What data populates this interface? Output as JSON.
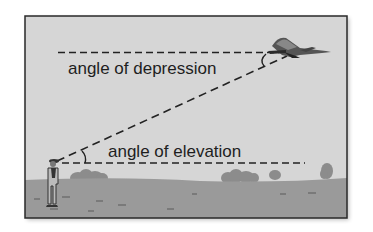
{
  "figure": {
    "labels": {
      "depression": "angle of depression",
      "elevation": "angle of elevation"
    },
    "elements": {
      "observer": "person-standing-on-ground",
      "aircraft": "airplane-in-flight",
      "line_of_sight": "dashed-line-of-sight",
      "horizontal_top": "dashed-horizontal-from-plane",
      "horizontal_bottom": "dashed-horizontal-from-observer"
    },
    "colors": {
      "sky": "#d6d6d6",
      "ground": "#9a9a9a",
      "frame": "#2a2a2a",
      "ink": "#1e1e1e",
      "bushes": "#888888"
    }
  }
}
